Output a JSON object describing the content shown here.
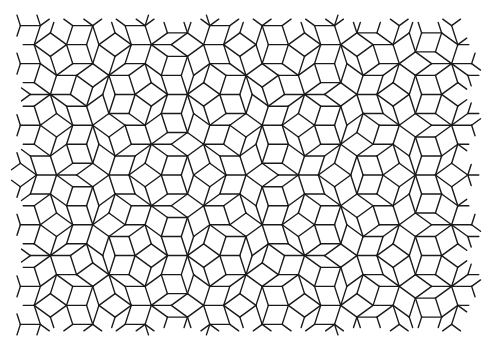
{
  "image": {
    "subject": "Penrose rhombus tiling (P3) line drawing",
    "width": 491,
    "height": 352,
    "background_color": "#ffffff",
    "line_color": "#1a1a1a"
  },
  "tiling": {
    "type": "penrose-p3-rhombus",
    "edge_length_px": 20,
    "region": {
      "left": 20,
      "top": 18,
      "right": 472,
      "bottom": 331
    },
    "center": {
      "x": 246,
      "y": 175
    },
    "rotation_deg": 90,
    "subdivisions": 8
  }
}
